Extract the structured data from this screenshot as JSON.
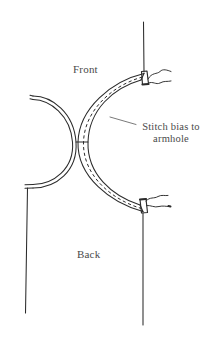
{
  "diagram": {
    "type": "line-drawing",
    "background_color": "#ffffff",
    "ink_color": "#2b2b2b",
    "text_color": "#4a4a4a",
    "labels": {
      "front": "Front",
      "back": "Back",
      "stitch_bias_line1": "Stitch bias to",
      "stitch_bias_line2": "armhole"
    },
    "parts": {
      "left_piece_name": "body-armhole-curve",
      "right_piece_name": "bias-strip-crescent",
      "stitch_line_name": "dashed-stitch-line",
      "connector_name": "seam-connector",
      "thread_tails": 2
    }
  }
}
